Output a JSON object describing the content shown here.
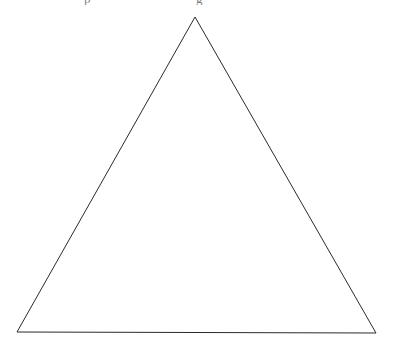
{
  "figure": {
    "name": "triangle",
    "shape_type": "isosceles-triangle",
    "background_color": "#ffffff",
    "stroke_color": "#2b2b2b",
    "stroke_width": 1,
    "fill": "none",
    "canvas": {
      "width": 394,
      "height": 346
    },
    "vertices": [
      {
        "label": "apex",
        "x": 195,
        "y": 17
      },
      {
        "label": "bottom-right",
        "x": 376,
        "y": 333
      },
      {
        "label": "bottom-left",
        "x": 17,
        "y": 332
      }
    ],
    "points_attr": "195,17 376,333 17,332"
  },
  "clipped_header": {
    "visible": true,
    "note": "partially cropped text descenders at the top edge",
    "fragment_left": "p",
    "fragment_right": "g"
  }
}
